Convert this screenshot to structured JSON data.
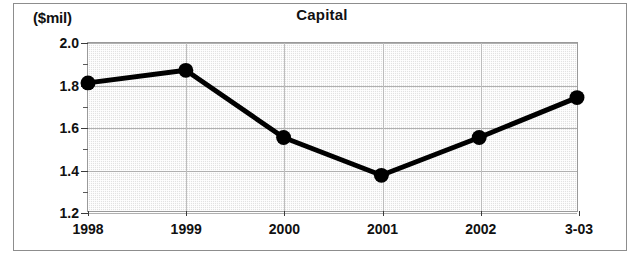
{
  "figure": {
    "title": "Capital",
    "y_unit_caption": "($mil)"
  },
  "chart_data": {
    "type": "line",
    "title": "Capital",
    "xlabel": "",
    "ylabel": "($mil)",
    "categories": [
      "1998",
      "1999",
      "2000",
      "2001",
      "2002",
      "3-03"
    ],
    "values": [
      1.81,
      1.87,
      1.55,
      1.37,
      1.55,
      1.74
    ],
    "series": [
      {
        "name": "Capital",
        "values": [
          1.81,
          1.87,
          1.55,
          1.37,
          1.55,
          1.74
        ]
      }
    ],
    "ylim": [
      1.2,
      2.0
    ],
    "ytick_labels": [
      "1.2",
      "1.4",
      "1.6",
      "1.8",
      "2.0"
    ],
    "ytick_values": [
      1.2,
      1.4,
      1.6,
      1.8,
      2.0
    ],
    "yminor_tick_values": [
      1.3,
      1.5,
      1.7,
      1.9
    ],
    "grid": true,
    "legend": false,
    "legend_position": "none",
    "marker": "filled-circle",
    "line_color": "#000000",
    "marker_color": "#000000",
    "plot_background": "#e2e2e2"
  }
}
